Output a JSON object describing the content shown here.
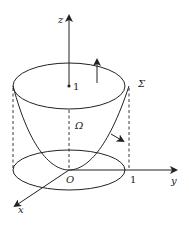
{
  "figure": {
    "type": "3d-surface-diagram",
    "labels": {
      "z_axis": "z",
      "y_axis": "y",
      "x_axis": "x",
      "origin": "O",
      "height_tick": "1",
      "radius_tick": "1",
      "surface": "Σ",
      "region": "Ω"
    },
    "colors": {
      "stroke": "#222222",
      "background": "#ffffff"
    }
  }
}
